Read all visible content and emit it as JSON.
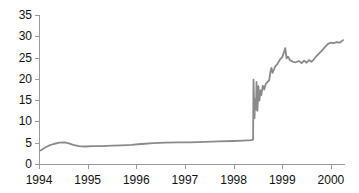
{
  "figure": {
    "background": "#ffffff"
  },
  "chart_data": {
    "type": "line",
    "title": "",
    "subtitle": "",
    "xlabel": "",
    "ylabel": "",
    "grid": false,
    "legend": "none",
    "xlim": [
      1994,
      2000.29
    ],
    "ylim": [
      0,
      35
    ],
    "x_tick_values": [
      1994,
      1995,
      1996,
      1997,
      1998,
      1999,
      2000
    ],
    "x_tick_labels": [
      "1994",
      "1995",
      "1996",
      "1997",
      "1998",
      "1999",
      "2000"
    ],
    "y_tick_values": [
      0,
      5,
      10,
      15,
      20,
      25,
      30,
      35
    ],
    "y_tick_labels": [
      "0",
      "5",
      "10",
      "15",
      "20",
      "25",
      "30",
      "35"
    ],
    "colors": {
      "line": "#8a8a8a",
      "axis": "#9a9a9a",
      "tick": "#9a9a9a",
      "label": "#111111",
      "background": "#ffffff"
    },
    "series": [
      {
        "name": "value",
        "points": [
          [
            1994.03,
            3.2
          ],
          [
            1994.1,
            3.7
          ],
          [
            1994.2,
            4.3
          ],
          [
            1994.3,
            4.7
          ],
          [
            1994.42,
            5.0
          ],
          [
            1994.52,
            5.1
          ],
          [
            1994.6,
            4.9
          ],
          [
            1994.7,
            4.5
          ],
          [
            1994.82,
            4.2
          ],
          [
            1994.95,
            4.1
          ],
          [
            1995.1,
            4.2
          ],
          [
            1995.3,
            4.2
          ],
          [
            1995.5,
            4.3
          ],
          [
            1995.7,
            4.4
          ],
          [
            1995.9,
            4.5
          ],
          [
            1996.1,
            4.7
          ],
          [
            1996.35,
            4.9
          ],
          [
            1996.6,
            5.0
          ],
          [
            1996.85,
            5.1
          ],
          [
            1997.1,
            5.1
          ],
          [
            1997.4,
            5.2
          ],
          [
            1997.7,
            5.3
          ],
          [
            1998.0,
            5.4
          ],
          [
            1998.2,
            5.5
          ],
          [
            1998.36,
            5.6
          ],
          [
            1998.4,
            5.7
          ],
          [
            1998.41,
            19.8
          ],
          [
            1998.43,
            10.8
          ],
          [
            1998.44,
            15.2
          ],
          [
            1998.46,
            12.8
          ],
          [
            1998.47,
            19.3
          ],
          [
            1998.49,
            12.5
          ],
          [
            1998.51,
            18.3
          ],
          [
            1998.53,
            14.9
          ],
          [
            1998.55,
            17.3
          ],
          [
            1998.57,
            16.2
          ],
          [
            1998.6,
            18.4
          ],
          [
            1998.63,
            17.5
          ],
          [
            1998.66,
            18.8
          ],
          [
            1998.7,
            19.3
          ],
          [
            1998.73,
            19.6
          ],
          [
            1998.76,
            21.9
          ],
          [
            1998.78,
            22.6
          ],
          [
            1998.8,
            21.4
          ],
          [
            1998.83,
            22.2
          ],
          [
            1998.86,
            23.0
          ],
          [
            1998.9,
            23.5
          ],
          [
            1998.95,
            24.5
          ],
          [
            1999.0,
            25.1
          ],
          [
            1999.03,
            26.1
          ],
          [
            1999.06,
            27.2
          ],
          [
            1999.09,
            24.8
          ],
          [
            1999.12,
            25.2
          ],
          [
            1999.16,
            24.4
          ],
          [
            1999.22,
            24.0
          ],
          [
            1999.28,
            23.9
          ],
          [
            1999.34,
            24.2
          ],
          [
            1999.4,
            23.7
          ],
          [
            1999.45,
            24.3
          ],
          [
            1999.5,
            23.8
          ],
          [
            1999.55,
            24.4
          ],
          [
            1999.6,
            24.0
          ],
          [
            1999.65,
            24.6
          ],
          [
            1999.7,
            25.3
          ],
          [
            1999.76,
            26.0
          ],
          [
            1999.82,
            26.7
          ],
          [
            1999.88,
            27.5
          ],
          [
            1999.94,
            28.2
          ],
          [
            2000.0,
            28.5
          ],
          [
            2000.06,
            28.4
          ],
          [
            2000.12,
            28.6
          ],
          [
            2000.18,
            28.5
          ],
          [
            2000.25,
            29.1
          ]
        ]
      }
    ]
  }
}
